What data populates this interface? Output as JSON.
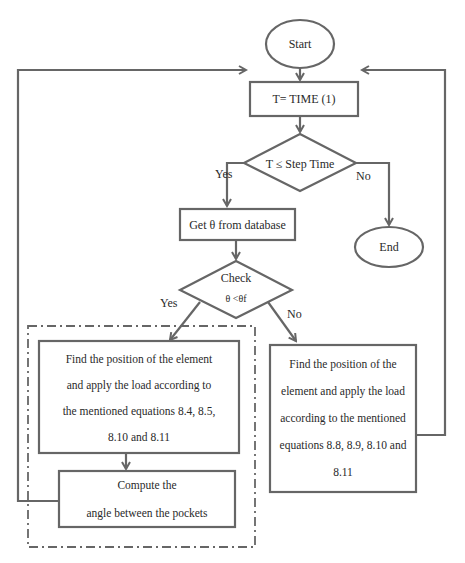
{
  "flowchart": {
    "start": "Start",
    "time_step": "T= TIME (1)",
    "decision_time": "T ≤ Step Time",
    "yes_label_1": "Yes",
    "no_label_1": "No",
    "get_theta": "Get θ from database",
    "end": "End",
    "check_title": "Check",
    "check_condition": "θ <θf",
    "yes_label_2": "Yes",
    "no_label_2": "No",
    "left_box_lines": [
      "Find the position of the element",
      "and apply the load according to",
      "the mentioned equations 8.4, 8.5,",
      "8.10 and 8.11"
    ],
    "compute_lines": [
      "Compute the",
      "angle between the pockets"
    ],
    "right_box_lines": [
      "Find the position of the",
      "element and apply the load",
      "according to the mentioned",
      "equations 8.8, 8.9, 8.10 and",
      "8.11"
    ]
  },
  "colors": {
    "stroke": "#666666",
    "text": "#2a2a2a"
  }
}
